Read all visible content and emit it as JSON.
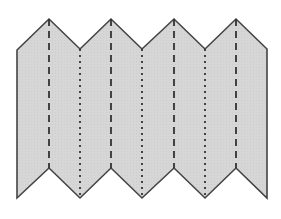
{
  "diagram": {
    "type": "folded-paper-zigzag",
    "fill_color": "#d6d6d6",
    "outline_color": "#444444",
    "fold_line_color": "#333333",
    "outline": [
      [
        17,
        50
      ],
      [
        49,
        19
      ],
      [
        80,
        49
      ],
      [
        111,
        19
      ],
      [
        142,
        49
      ],
      [
        174,
        19
      ],
      [
        205,
        49
      ],
      [
        236,
        19
      ],
      [
        267,
        49
      ],
      [
        267,
        198
      ],
      [
        236,
        168
      ],
      [
        205,
        198
      ],
      [
        174,
        168
      ],
      [
        142,
        198
      ],
      [
        111,
        168
      ],
      [
        80,
        198
      ],
      [
        49,
        168
      ],
      [
        17,
        198
      ]
    ],
    "mountain_folds": [
      {
        "x": 49,
        "y1": 19,
        "y2": 168,
        "style": "dashed"
      },
      {
        "x": 111,
        "y1": 19,
        "y2": 168,
        "style": "dashed"
      },
      {
        "x": 174,
        "y1": 19,
        "y2": 168,
        "style": "dashed"
      },
      {
        "x": 236,
        "y1": 19,
        "y2": 168,
        "style": "dashed"
      }
    ],
    "valley_folds": [
      {
        "x": 80,
        "y1": 49,
        "y2": 198,
        "style": "dotted"
      },
      {
        "x": 142,
        "y1": 49,
        "y2": 198,
        "style": "dotted"
      },
      {
        "x": 205,
        "y1": 49,
        "y2": 198,
        "style": "dotted"
      }
    ]
  }
}
